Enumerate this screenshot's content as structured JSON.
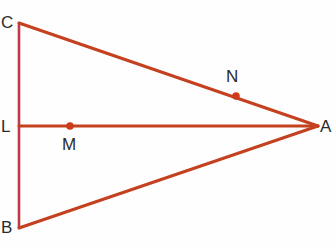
{
  "figure": {
    "background_color": "#fefefe",
    "line_color": "#c4401f",
    "vertical_line_color": "#c03a46",
    "dot_color": "#cf3a1c",
    "label_color": "#2b2b2b",
    "width": 334,
    "height": 248
  },
  "labels": {
    "C": "C",
    "B": "B",
    "L": "L",
    "A": "A",
    "N": "N",
    "M": "M"
  },
  "chart_data": {
    "type": "diagram",
    "points": [
      {
        "name": "C",
        "x": 19,
        "y": 23,
        "labeled": true,
        "dot": false
      },
      {
        "name": "B",
        "x": 19,
        "y": 228,
        "labeled": true,
        "dot": false
      },
      {
        "name": "L",
        "x": 19,
        "y": 126,
        "labeled": true,
        "dot": false
      },
      {
        "name": "A",
        "x": 318,
        "y": 126,
        "labeled": true,
        "dot": false
      },
      {
        "name": "M",
        "x": 70,
        "y": 126,
        "labeled": true,
        "dot": true
      },
      {
        "name": "N",
        "x": 236,
        "y": 96,
        "labeled": true,
        "dot": true
      }
    ],
    "segments": [
      {
        "name": "CB",
        "from": "C",
        "to": "B",
        "color": "#c03a46",
        "width": 2.6
      },
      {
        "name": "CA",
        "from": "C",
        "to": "A",
        "color": "#c4401f",
        "width": 3.0
      },
      {
        "name": "BA",
        "from": "B",
        "to": "A",
        "color": "#c4401f",
        "width": 3.0
      },
      {
        "name": "LA",
        "from": "L",
        "to": "A",
        "color": "#c4401f",
        "width": 3.0
      }
    ],
    "dot_radius": 3.8,
    "xlabel": "",
    "ylabel": "",
    "grid": false,
    "legend": false
  }
}
